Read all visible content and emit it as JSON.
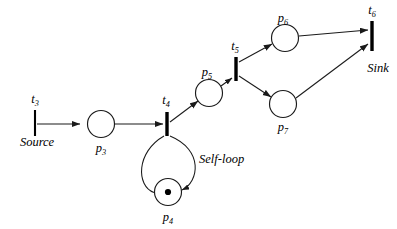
{
  "diagram": {
    "annotations": [
      {
        "id": "source",
        "text": "Source",
        "x": 37,
        "y": 146
      },
      {
        "id": "sink",
        "text": "Sink",
        "x": 378,
        "y": 72
      },
      {
        "id": "self-loop",
        "text": "Self-loop",
        "x": 199,
        "y": 163
      }
    ],
    "places": [
      {
        "id": "p3",
        "base": "p",
        "sub": "3",
        "cx": 101,
        "cy": 124,
        "r": 13.5,
        "tokens": 0,
        "label_x": 101,
        "label_y": 152
      },
      {
        "id": "p4",
        "base": "p",
        "sub": "4",
        "cx": 168,
        "cy": 192,
        "r": 13.5,
        "tokens": 1,
        "label_x": 168,
        "label_y": 221
      },
      {
        "id": "p5",
        "base": "p",
        "sub": "5",
        "cx": 209,
        "cy": 93,
        "r": 13.5,
        "tokens": 0,
        "label_x": 207,
        "label_y": 76
      },
      {
        "id": "p6",
        "base": "p",
        "sub": "6",
        "cx": 285,
        "cy": 38,
        "r": 13.5,
        "tokens": 0,
        "label_x": 283,
        "label_y": 22
      },
      {
        "id": "p7",
        "base": "p",
        "sub": "7",
        "cx": 283,
        "cy": 104,
        "r": 13.5,
        "tokens": 0,
        "label_x": 283,
        "label_y": 131
      }
    ],
    "transitions": [
      {
        "id": "t3",
        "base": "t",
        "sub": "3",
        "x": 35,
        "y_top": 110,
        "y_bottom": 136,
        "width": 2.1,
        "label_x": 35,
        "label_y": 103
      },
      {
        "id": "t4",
        "base": "t",
        "sub": "4",
        "x": 167,
        "y_top": 112,
        "y_bottom": 136,
        "width": 3.4,
        "label_x": 166,
        "label_y": 104
      },
      {
        "id": "t5",
        "base": "t",
        "sub": "5",
        "x": 236,
        "y_top": 57,
        "y_bottom": 81,
        "width": 3.4,
        "label_x": 235,
        "label_y": 50
      },
      {
        "id": "t6",
        "base": "t",
        "sub": "6",
        "x": 372,
        "y_top": 21,
        "y_bottom": 51,
        "width": 3.4,
        "label_x": 372,
        "label_y": 14
      }
    ],
    "arcs": [
      {
        "id": "arc-t3-p3",
        "from": "t3",
        "to": "p3",
        "kind": "line"
      },
      {
        "id": "arc-p3-t4",
        "from": "p3",
        "to": "t4",
        "kind": "line"
      },
      {
        "id": "arc-t4-p4",
        "from": "t4",
        "to": "p4",
        "kind": "curve"
      },
      {
        "id": "arc-p4-t4",
        "from": "p4",
        "to": "t4",
        "kind": "curve"
      },
      {
        "id": "arc-t4-p5",
        "from": "t4",
        "to": "p5",
        "kind": "line"
      },
      {
        "id": "arc-p5-t5",
        "from": "p5",
        "to": "t5",
        "kind": "line"
      },
      {
        "id": "arc-t5-p6",
        "from": "t5",
        "to": "p6",
        "kind": "line"
      },
      {
        "id": "arc-t5-p7",
        "from": "t5",
        "to": "p7",
        "kind": "line"
      },
      {
        "id": "arc-p6-t6",
        "from": "p6",
        "to": "t6",
        "kind": "line"
      },
      {
        "id": "arc-p7-t6",
        "from": "p7",
        "to": "t6",
        "kind": "line"
      }
    ],
    "colors": {
      "background": "#ffffff",
      "stroke": "#1a1a1a",
      "token": "#000000",
      "text": "#000000"
    }
  }
}
